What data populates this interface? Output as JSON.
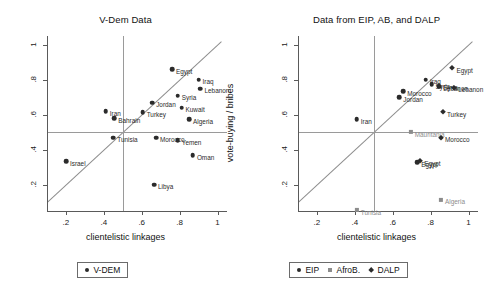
{
  "figure": {
    "panels": [
      {
        "id": "vdem",
        "title": "V-Dem Data",
        "xlabel": "clientelistic linkages",
        "ylabel": "vote-buying",
        "legend": [
          {
            "label": "V-DEM",
            "marker": "circle"
          }
        ]
      },
      {
        "id": "eip-ab-dalp",
        "title": "Data from EIP, AB, and DALP",
        "xlabel": "clientelistic linkages",
        "ylabel": "vote-buying / bribes",
        "legend": [
          {
            "label": "EIP",
            "marker": "circle"
          },
          {
            "label": "AfroB.",
            "marker": "square"
          },
          {
            "label": "DALP",
            "marker": "diamond"
          }
        ]
      }
    ],
    "xticks": [
      ".2",
      ".4",
      ".6",
      ".8",
      "1"
    ],
    "yticks": [
      "1",
      ".8",
      ".6",
      ".4",
      ".2"
    ]
  },
  "chart_data": [
    {
      "type": "scatter",
      "title": "V-Dem Data",
      "xlabel": "clientelistic linkages",
      "ylabel": "vote-buying",
      "xlim": [
        0.1,
        1.05
      ],
      "ylim": [
        0.05,
        1.05
      ],
      "grid": false,
      "legend_position": "below",
      "reference_lines": {
        "horizontal": 0.5,
        "vertical": 0.5,
        "diagonal": "y = x"
      },
      "series": [
        {
          "name": "V-DEM",
          "marker": "circle",
          "points": [
            {
              "label": "Egypt",
              "x": 0.76,
              "y": 0.86
            },
            {
              "label": "Iraq",
              "x": 0.9,
              "y": 0.8
            },
            {
              "label": "Lebanon",
              "x": 0.91,
              "y": 0.75
            },
            {
              "label": "Syria",
              "x": 0.79,
              "y": 0.71
            },
            {
              "label": "Jordan",
              "x": 0.655,
              "y": 0.67
            },
            {
              "label": "Kuwait",
              "x": 0.81,
              "y": 0.64
            },
            {
              "label": "Iran",
              "x": 0.41,
              "y": 0.62
            },
            {
              "label": "Turkey",
              "x": 0.605,
              "y": 0.615
            },
            {
              "label": "Bahrain",
              "x": 0.455,
              "y": 0.58
            },
            {
              "label": "Algeria",
              "x": 0.85,
              "y": 0.575
            },
            {
              "label": "Tunisia",
              "x": 0.45,
              "y": 0.47
            },
            {
              "label": "Morocco",
              "x": 0.675,
              "y": 0.47
            },
            {
              "label": "Yemen",
              "x": 0.79,
              "y": 0.455
            },
            {
              "label": "Oman",
              "x": 0.87,
              "y": 0.37
            },
            {
              "label": "Israel",
              "x": 0.2,
              "y": 0.335
            },
            {
              "label": "Libya",
              "x": 0.665,
              "y": 0.2
            }
          ]
        }
      ]
    },
    {
      "type": "scatter",
      "title": "Data from EIP, AB, and DALP",
      "xlabel": "clientelistic linkages",
      "ylabel": "vote-buying / bribes",
      "xlim": [
        0.1,
        1.05
      ],
      "ylim": [
        0.05,
        1.05
      ],
      "grid": false,
      "legend_position": "below",
      "reference_lines": {
        "horizontal": 0.5,
        "vertical": 0.5,
        "diagonal": "y = x"
      },
      "series": [
        {
          "name": "EIP",
          "marker": "circle",
          "points": [
            {
              "label": "Iraq",
              "x": 0.775,
              "y": 0.8
            },
            {
              "label": "Syria",
              "x": 0.805,
              "y": 0.775
            },
            {
              "label": "Lebanon",
              "x": 0.845,
              "y": 0.76
            },
            {
              "label": "Morocco",
              "x": 0.655,
              "y": 0.735
            },
            {
              "label": "Jordan",
              "x": 0.635,
              "y": 0.7
            },
            {
              "label": "Iran",
              "x": 0.41,
              "y": 0.575
            },
            {
              "label": "Egypt",
              "x": 0.73,
              "y": 0.33
            }
          ]
        },
        {
          "name": "AfroB.",
          "marker": "square",
          "points": [
            {
              "label": "Mauritania",
              "x": 0.695,
              "y": 0.5
            },
            {
              "label": "Algeria",
              "x": 0.855,
              "y": 0.115
            },
            {
              "label": "Tunisia",
              "x": 0.41,
              "y": 0.055
            }
          ]
        },
        {
          "name": "DALP",
          "marker": "diamond",
          "points": [
            {
              "label": "Egypt",
              "x": 0.915,
              "y": 0.865
            },
            {
              "label": "Syria",
              "x": 0.845,
              "y": 0.765
            },
            {
              "label": "Lebanon",
              "x": 0.925,
              "y": 0.755
            },
            {
              "label": "Turkey",
              "x": 0.865,
              "y": 0.615
            },
            {
              "label": "Morocco",
              "x": 0.855,
              "y": 0.47
            },
            {
              "label": "Egypt",
              "x": 0.745,
              "y": 0.335
            }
          ]
        }
      ]
    }
  ]
}
